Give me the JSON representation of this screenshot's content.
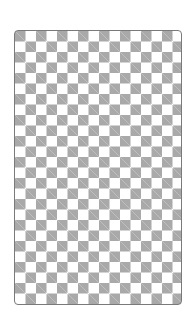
{
  "canvas": {
    "pattern": "checkerboard",
    "square_size_px": 10.5,
    "colors": {
      "light": "#ffffff",
      "dark": "#a9a9a9",
      "border": "#7a7a7a"
    }
  }
}
